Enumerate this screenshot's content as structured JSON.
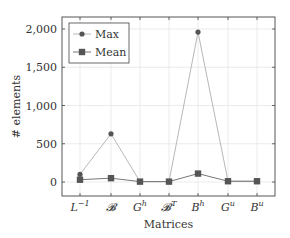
{
  "chart_data": {
    "type": "line",
    "title": "",
    "xlabel": "Matrices",
    "ylabel": "# elements",
    "categories": [
      "L^{-1}",
      "𝓑",
      "G^h",
      "𝓑^T",
      "B^h",
      "G^u",
      "B^u"
    ],
    "category_labels": [
      {
        "base": "L",
        "sup": "−1"
      },
      {
        "base": "𝓑",
        "sup": ""
      },
      {
        "base": "G",
        "sup": "h"
      },
      {
        "base": "𝓑",
        "sup": "T"
      },
      {
        "base": "B",
        "sup": "h"
      },
      {
        "base": "G",
        "sup": "u"
      },
      {
        "base": "B",
        "sup": "u"
      }
    ],
    "series": [
      {
        "name": "Max",
        "marker": "circle",
        "color": "#555555",
        "line_color": "#b8b8b8",
        "values": [
          100,
          630,
          5,
          5,
          1960,
          10,
          10
        ]
      },
      {
        "name": "Mean",
        "marker": "square",
        "color": "#555555",
        "line_color": "#777777",
        "values": [
          30,
          50,
          5,
          5,
          110,
          10,
          10
        ]
      }
    ],
    "yticks": [
      0,
      500,
      1000,
      1500,
      2000
    ],
    "ytick_labels": [
      "0",
      "500",
      "1,000",
      "1,500",
      "2,000"
    ],
    "ylim": [
      -180,
      2150
    ],
    "grid": true,
    "legend_position": "upper left"
  },
  "colors": {
    "axis": "#444444",
    "grid": "#e6e6e6",
    "marker": "#5a5a5a",
    "max_line": "#b8b8b8",
    "mean_line": "#7a7a7a"
  }
}
